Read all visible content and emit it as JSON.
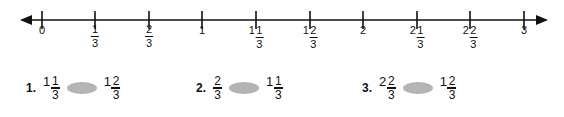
{
  "page": {
    "background_color": "#ffffff",
    "ink_color": "#111111"
  },
  "numberline": {
    "name": "number-line-0-to-3-thirds",
    "start_value": 0,
    "end_value": 3,
    "step": "1/3",
    "left_arrow": "arrow-left",
    "right_arrow": "arrow-right",
    "ticks": [
      {
        "x": 42,
        "value": "0",
        "whole": "0",
        "num": "",
        "den": ""
      },
      {
        "x": 95,
        "value": "1/3",
        "whole": "",
        "num": "1",
        "den": "3"
      },
      {
        "x": 149,
        "value": "2/3",
        "whole": "",
        "num": "2",
        "den": "3"
      },
      {
        "x": 202,
        "value": "1",
        "whole": "1",
        "num": "",
        "den": ""
      },
      {
        "x": 256,
        "value": "1 1/3",
        "whole": "1",
        "num": "1",
        "den": "3"
      },
      {
        "x": 310,
        "value": "1 2/3",
        "whole": "1",
        "num": "2",
        "den": "3"
      },
      {
        "x": 363,
        "value": "2",
        "whole": "2",
        "num": "",
        "den": ""
      },
      {
        "x": 417,
        "value": "2 1/3",
        "whole": "2",
        "num": "1",
        "den": "3"
      },
      {
        "x": 470,
        "value": "2 2/3",
        "whole": "2",
        "num": "2",
        "den": "3"
      },
      {
        "x": 524,
        "value": "3",
        "whole": "3",
        "num": "",
        "den": ""
      }
    ]
  },
  "exercises": {
    "oval_color": "#b4b4b4",
    "items": [
      {
        "number": "1.",
        "left": {
          "whole": "1",
          "num": "1",
          "den": "3"
        },
        "right": {
          "whole": "1",
          "num": "2",
          "den": "3"
        },
        "blank": "comparison-answer-oval",
        "x": 26
      },
      {
        "number": "2.",
        "left": {
          "whole": "",
          "num": "2",
          "den": "3"
        },
        "right": {
          "whole": "1",
          "num": "1",
          "den": "3"
        },
        "blank": "comparison-answer-oval",
        "x": 196
      },
      {
        "number": "3.",
        "left": {
          "whole": "2",
          "num": "2",
          "den": "3"
        },
        "right": {
          "whole": "1",
          "num": "2",
          "den": "3"
        },
        "blank": "comparison-answer-oval",
        "x": 362
      }
    ]
  }
}
